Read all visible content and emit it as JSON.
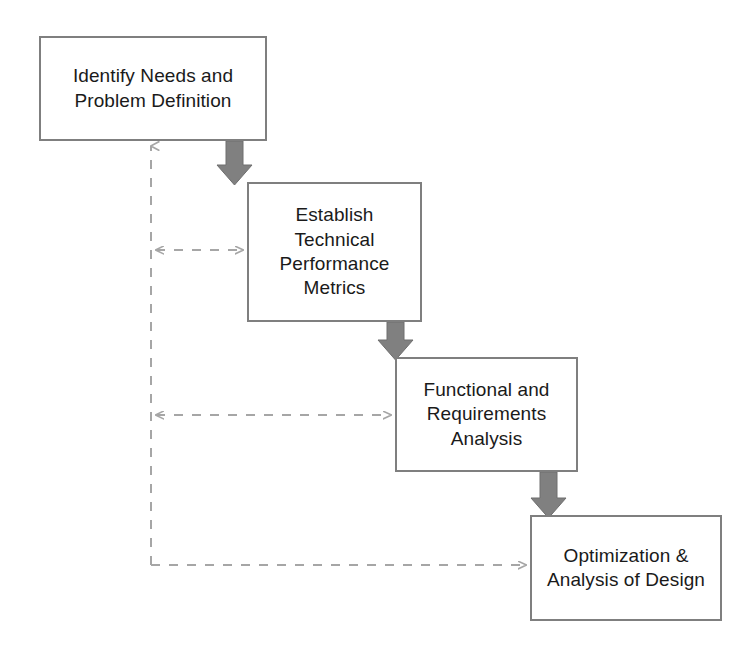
{
  "diagram": {
    "type": "flowchart",
    "canvas": {
      "width": 751,
      "height": 653,
      "background": "#ffffff"
    },
    "style": {
      "box_border_color": "#7f7f7f",
      "box_fill_color": "#ffffff",
      "text_color": "#1a1a1a",
      "solid_arrow_color": "#808080",
      "dashed_arrow_color": "#a6a6a6"
    },
    "nodes": [
      {
        "id": "identify-needs",
        "label": "Identify Needs and\nProblem Definition",
        "x": 39,
        "y": 36,
        "width": 228,
        "height": 105
      },
      {
        "id": "technical-metrics",
        "label": "Establish\nTechnical\nPerformance\nMetrics",
        "x": 247,
        "y": 182,
        "width": 175,
        "height": 140
      },
      {
        "id": "requirements-analysis",
        "label": "Functional and\nRequirements\nAnalysis",
        "x": 395,
        "y": 357,
        "width": 183,
        "height": 115
      },
      {
        "id": "optimization-design",
        "label": "Optimization &\nAnalysis of Design",
        "x": 530,
        "y": 515,
        "width": 192,
        "height": 106
      }
    ],
    "connectors": [
      {
        "id": "flow-1-to-2",
        "kind": "solid-down-arrow",
        "from": "identify-needs",
        "to": "technical-metrics"
      },
      {
        "id": "flow-2-to-3",
        "kind": "solid-down-arrow",
        "from": "technical-metrics",
        "to": "requirements-analysis"
      },
      {
        "id": "flow-3-to-4",
        "kind": "solid-down-arrow",
        "from": "requirements-analysis",
        "to": "optimization-design"
      },
      {
        "id": "feedback-spine",
        "kind": "dashed-line-up-arrow",
        "from": "feedback-bus",
        "to": "identify-needs"
      },
      {
        "id": "feedback-to-2",
        "kind": "dashed-double-arrow",
        "from": "feedback-bus",
        "to": "technical-metrics"
      },
      {
        "id": "feedback-to-3",
        "kind": "dashed-double-arrow",
        "from": "feedback-bus",
        "to": "requirements-analysis"
      },
      {
        "id": "feedback-to-4",
        "kind": "dashed-arrow",
        "from": "feedback-bus",
        "to": "optimization-design"
      }
    ]
  }
}
